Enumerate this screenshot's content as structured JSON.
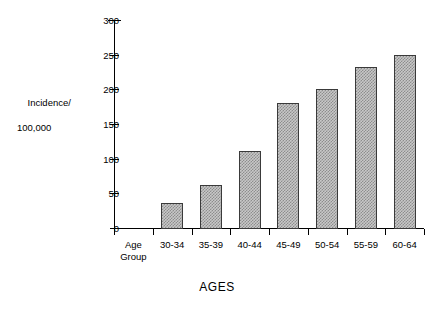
{
  "chart_data": {
    "type": "bar",
    "title": "",
    "subtitle": "",
    "xlabel": "AGES",
    "ylabel": "Incidence/ 100,000",
    "ylabel_line1": "Incidence/",
    "ylabel_line2": "100,000",
    "categories": [
      "Age Group",
      "30-34",
      "35-39",
      "40-44",
      "45-49",
      "50-54",
      "55-59",
      "60-64"
    ],
    "category_labels": [
      {
        "line1": "Age",
        "line2": "Group"
      },
      {
        "line1": "30-34",
        "line2": ""
      },
      {
        "line1": "35-39",
        "line2": ""
      },
      {
        "line1": "40-44",
        "line2": ""
      },
      {
        "line1": "45-49",
        "line2": ""
      },
      {
        "line1": "50-54",
        "line2": ""
      },
      {
        "line1": "55-59",
        "line2": ""
      },
      {
        "line1": "60-64",
        "line2": ""
      }
    ],
    "values": [
      null,
      37,
      64,
      113,
      182,
      202,
      233,
      251
    ],
    "bars": [
      {
        "category": "30-34",
        "value": 37
      },
      {
        "category": "35-39",
        "value": 64
      },
      {
        "category": "40-44",
        "value": 113
      },
      {
        "category": "45-49",
        "value": 182
      },
      {
        "category": "50-54",
        "value": 202
      },
      {
        "category": "55-59",
        "value": 233
      },
      {
        "category": "60-64",
        "value": 251
      }
    ],
    "ylim": [
      0,
      300
    ],
    "yticks": [
      0,
      50,
      100,
      150,
      200,
      250,
      300
    ],
    "ytick_labels": [
      "0",
      "50",
      "100",
      "150",
      "200",
      "250",
      "300"
    ],
    "grid": false,
    "legend": false,
    "legend_position": "none",
    "bar_fill_color": "#c8c8c8",
    "bar_border_color": "#3a3a3a",
    "axis_color": "#000000",
    "background_color": "#ffffff"
  }
}
